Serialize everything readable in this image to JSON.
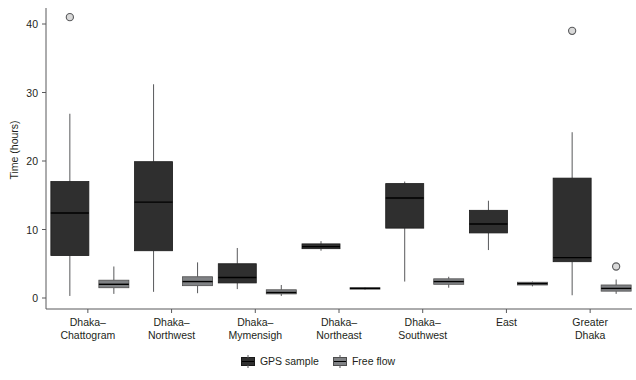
{
  "chart_data": {
    "type": "box",
    "title": "",
    "xlabel": "",
    "ylabel": "Time (hours)",
    "ylim": [
      -1.5,
      42.5
    ],
    "yticks": [
      0,
      10,
      20,
      30,
      40
    ],
    "grid": false,
    "legend_position": "bottom",
    "categories": [
      "Dhaka–\nChattogram",
      "Dhaka–\nNorthwest",
      "Dhaka–\nMymensigh",
      "Dhaka–\nNortheast",
      "Dhaka–\nSouthwest",
      "East",
      "Greater\nDhaka"
    ],
    "category_lines": [
      [
        "Dhaka–",
        "Chattogram"
      ],
      [
        "Dhaka–",
        "Northwest"
      ],
      [
        "Dhaka–",
        "Mymensigh"
      ],
      [
        "Dhaka–",
        "Northeast"
      ],
      [
        "Dhaka–",
        "Southwest"
      ],
      [
        "East",
        ""
      ],
      [
        "Greater",
        "Dhaka"
      ]
    ],
    "series": [
      {
        "name": "GPS sample",
        "color": "#2f2f2f",
        "boxes": [
          {
            "category": "Dhaka–Chattogram",
            "whisker_low": 0.3,
            "q1": 6.2,
            "median": 12.4,
            "q3": 17.0,
            "whisker_high": 26.9,
            "outliers": [
              41.0
            ]
          },
          {
            "category": "Dhaka–Northwest",
            "whisker_low": 0.9,
            "q1": 6.9,
            "median": 14.0,
            "q3": 19.9,
            "whisker_high": 31.2,
            "outliers": []
          },
          {
            "category": "Dhaka–Mymensigh",
            "whisker_low": 1.3,
            "q1": 2.2,
            "median": 3.0,
            "q3": 5.0,
            "whisker_high": 7.3,
            "outliers": []
          },
          {
            "category": "Dhaka–Northeast",
            "whisker_low": 6.9,
            "q1": 7.2,
            "median": 7.5,
            "q3": 7.9,
            "whisker_high": 8.3,
            "outliers": []
          },
          {
            "category": "Dhaka–Southwest",
            "whisker_low": 2.4,
            "q1": 10.2,
            "median": 14.6,
            "q3": 16.7,
            "whisker_high": 17.0,
            "outliers": []
          },
          {
            "category": "East",
            "whisker_low": 7.0,
            "q1": 9.5,
            "median": 10.8,
            "q3": 12.8,
            "whisker_high": 14.2,
            "outliers": []
          },
          {
            "category": "Greater Dhaka",
            "whisker_low": 0.4,
            "q1": 5.3,
            "median": 5.9,
            "q3": 17.5,
            "whisker_high": 24.2,
            "outliers": [
              39.0
            ]
          }
        ]
      },
      {
        "name": "Free flow",
        "color": "#808285",
        "boxes": [
          {
            "category": "Dhaka–Chattogram",
            "whisker_low": 0.6,
            "q1": 1.5,
            "median": 2.0,
            "q3": 2.6,
            "whisker_high": 4.6,
            "outliers": []
          },
          {
            "category": "Dhaka–Northwest",
            "whisker_low": 0.7,
            "q1": 1.8,
            "median": 2.4,
            "q3": 3.1,
            "whisker_high": 5.2,
            "outliers": []
          },
          {
            "category": "Dhaka–Mymensigh",
            "whisker_low": 0.3,
            "q1": 0.6,
            "median": 0.8,
            "q3": 1.2,
            "whisker_high": 1.9,
            "outliers": []
          },
          {
            "category": "Dhaka–Northeast",
            "whisker_low": 1.2,
            "q1": 1.3,
            "median": 1.4,
            "q3": 1.5,
            "whisker_high": 1.6,
            "outliers": []
          },
          {
            "category": "Dhaka–Southwest",
            "whisker_low": 1.5,
            "q1": 2.0,
            "median": 2.4,
            "q3": 2.8,
            "whisker_high": 3.1,
            "outliers": []
          },
          {
            "category": "East",
            "whisker_low": 1.7,
            "q1": 1.9,
            "median": 2.1,
            "q3": 2.3,
            "whisker_high": 2.4,
            "outliers": []
          },
          {
            "category": "Greater Dhaka",
            "whisker_low": 0.6,
            "q1": 1.0,
            "median": 1.4,
            "q3": 1.9,
            "whisker_high": 2.7,
            "outliers": [
              4.6
            ]
          }
        ]
      }
    ]
  },
  "axis": {
    "y_title": "Time (hours)",
    "y_tick_labels": [
      "0",
      "10",
      "20",
      "30",
      "40"
    ]
  },
  "legend": {
    "items": [
      {
        "label": "GPS sample",
        "color": "#2f2f2f"
      },
      {
        "label": "Free flow",
        "color": "#808285"
      }
    ]
  }
}
